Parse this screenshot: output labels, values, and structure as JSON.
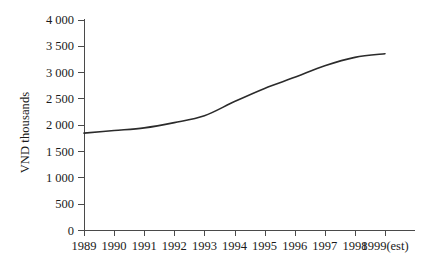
{
  "chart_data": {
    "type": "line",
    "title": "",
    "xlabel": "",
    "ylabel": "VND thousands",
    "x": [
      "1989",
      "1990",
      "1991",
      "1992",
      "1993",
      "1994",
      "1995",
      "1996",
      "1997",
      "1998",
      "1999(est)"
    ],
    "xtick_labels": [
      "1989",
      "1990",
      "1991",
      "1992",
      "1993",
      "1994",
      "1995",
      "1996",
      "1997",
      "1998",
      "1999(est)"
    ],
    "ytick_labels": [
      "0",
      "500",
      "1 000",
      "1 500",
      "2 000",
      "2 500",
      "3 000",
      "3 500",
      "4 000"
    ],
    "ytick_values": [
      0,
      500,
      1000,
      1500,
      2000,
      2500,
      3000,
      3500,
      4000
    ],
    "ylim": [
      0,
      4000
    ],
    "values": [
      1850,
      1900,
      1950,
      2050,
      2180,
      2450,
      2700,
      2910,
      3130,
      3290,
      3360
    ],
    "series": [
      {
        "name": "VND thousands",
        "values": [
          1850,
          1900,
          1950,
          2050,
          2180,
          2450,
          2700,
          2910,
          3130,
          3290,
          3360
        ]
      }
    ],
    "grid": false,
    "legend": false,
    "legend_position": "none",
    "line_color": "#2b2b2b",
    "axis_color": "#4a4a4a",
    "background_color": "#ffffff"
  }
}
